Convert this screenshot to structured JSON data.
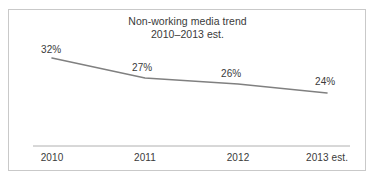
{
  "chart_data": {
    "type": "line",
    "title": "Non-working media trend",
    "subtitle": "2010–2013 est.",
    "xlabel": "",
    "ylabel": "",
    "categories": [
      "2010",
      "2011",
      "2012",
      "2013 est."
    ],
    "values": [
      32,
      27,
      26,
      24
    ],
    "value_labels": [
      "32%",
      "27%",
      "26%",
      "24%"
    ],
    "series": [
      {
        "name": "Non-working media share",
        "values": [
          32,
          27,
          26,
          24
        ]
      }
    ],
    "ylim": [
      0,
      40
    ],
    "grid": false,
    "legend": "none",
    "line_color": "#808080",
    "text_color": "#3a3a3a",
    "axis_color": "#b0b0b0",
    "border_color": "#c9c9c9",
    "background": "#ffffff",
    "points": [
      {
        "x": 52,
        "y": 58,
        "category": "2010",
        "label": "32%"
      },
      {
        "x": 145,
        "y": 78,
        "category": "2011",
        "label": "27%"
      },
      {
        "x": 238,
        "y": 84,
        "category": "2012",
        "label": "26%"
      },
      {
        "x": 327,
        "y": 93,
        "category": "2013 est.",
        "label": "24%"
      }
    ]
  },
  "figure": {
    "title": "Non-working media trend",
    "subtitle": "2010–2013 est."
  },
  "labels": {
    "v0": "32%",
    "v1": "27%",
    "v2": "26%",
    "v3": "24%",
    "x0": "2010",
    "x1": "2011",
    "x2": "2012",
    "x3": "2013 est."
  }
}
